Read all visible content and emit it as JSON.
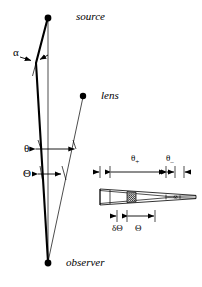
{
  "figure": {
    "name": "gravitational-lensing-geometry-diagram",
    "background_color": "#ffffff",
    "stroke_color": "#000000",
    "width": 202,
    "height": 287
  },
  "labels": {
    "source": "source",
    "lens": "lens",
    "observer": "observer"
  },
  "angles": {
    "alpha": "α",
    "theta_lower": "θ",
    "theta_upper": "Θ"
  },
  "inset": {
    "theta_plus_base": "θ",
    "theta_plus_sub": "+",
    "theta_minus_base": "θ",
    "theta_minus_sub": "–",
    "delta_theta": "δΘ",
    "theta_upper": "Θ"
  },
  "points": {
    "source": {
      "x": 48,
      "y": 18,
      "label": "source"
    },
    "lens": {
      "x": 83,
      "y": 96,
      "label": "lens"
    },
    "observer": {
      "x": 48,
      "y": 263,
      "label": "observer"
    }
  },
  "geometry_notes": {
    "straight_ray": "source-to-observer direct line (thin vertical)",
    "bent_ray_left": "source to observer via deflection kink at left",
    "lens_ray": "lens to observer straight line",
    "alpha_marker": "deflection angle at kink point",
    "theta_marker": "angular separation arrow, lower theta",
    "theta_upper_marker": "angular separation arrow, upper Theta"
  }
}
